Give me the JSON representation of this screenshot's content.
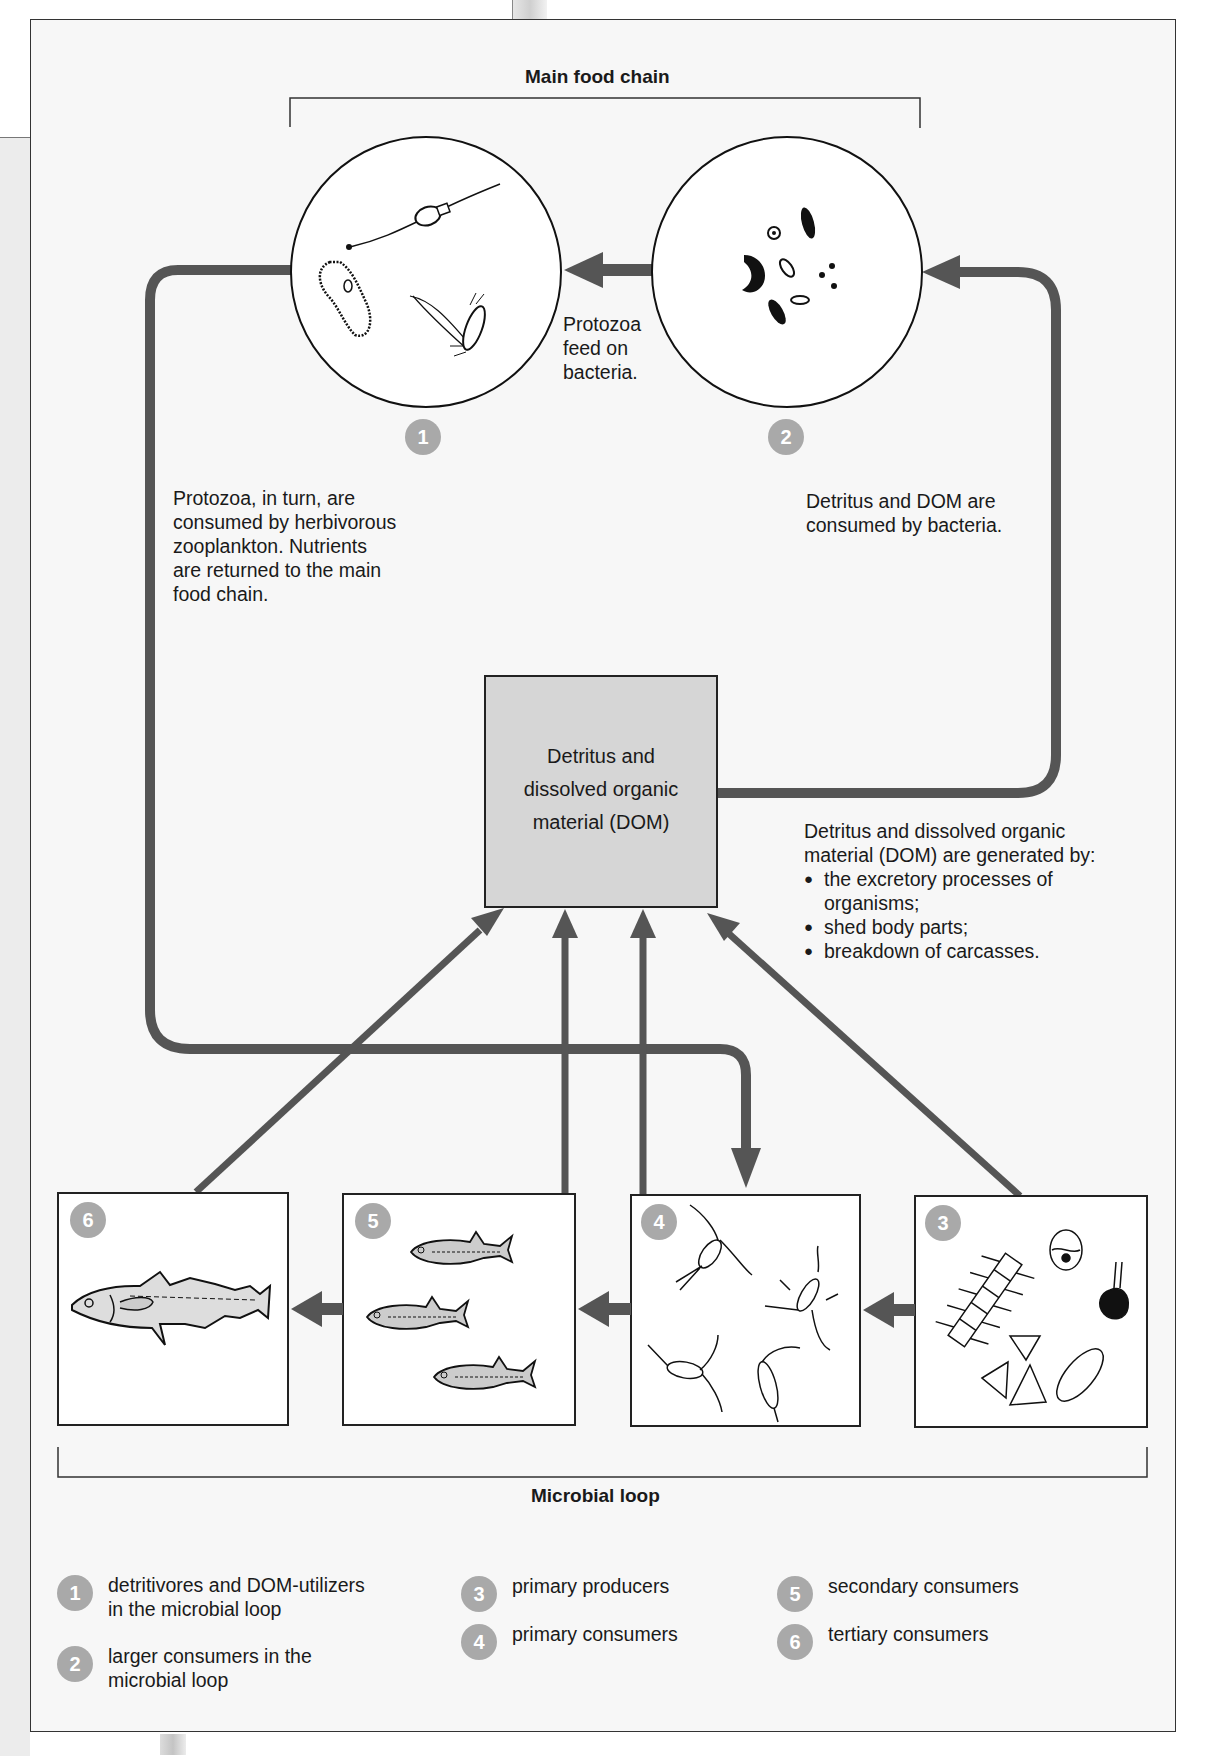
{
  "main_food_chain": {
    "title": "Main food chain",
    "circles": [
      {
        "badge": "1",
        "name": "protozoa"
      },
      {
        "badge": "2",
        "name": "bacteria"
      }
    ],
    "arrow_label": [
      "Protozoa",
      "feed on",
      "bacteria."
    ]
  },
  "annotations": {
    "left": [
      "Protozoa, in turn, are",
      "consumed by herbivorous",
      "zooplankton. Nutrients",
      "are returned to the main",
      "food chain."
    ],
    "right": [
      "Detritus and DOM are",
      "consumed by bacteria."
    ],
    "dom_generation": {
      "intro": [
        "Detritus and dissolved organic",
        "material (DOM) are generated by:"
      ],
      "bullets": [
        "the excretory processes of",
        "organisms;",
        "shed body parts;",
        "breakdown of carcasses."
      ]
    }
  },
  "dom_box": {
    "lines": [
      "Detritus and",
      "dissolved organic",
      "material (DOM)"
    ],
    "fill": "#d6d6d6"
  },
  "microbial_loop": {
    "title": "Microbial loop",
    "boxes": [
      {
        "badge": "6",
        "name": "large-fish"
      },
      {
        "badge": "5",
        "name": "small-fish"
      },
      {
        "badge": "4",
        "name": "zooplankton"
      },
      {
        "badge": "3",
        "name": "phytoplankton"
      }
    ]
  },
  "legend": [
    {
      "badge": "1",
      "lines": [
        "detritivores and DOM-utilizers",
        "in the microbial loop"
      ]
    },
    {
      "badge": "2",
      "lines": [
        "larger consumers in the",
        "microbial loop"
      ]
    },
    {
      "badge": "3",
      "lines": [
        "primary producers"
      ]
    },
    {
      "badge": "4",
      "lines": [
        "primary consumers"
      ]
    },
    {
      "badge": "5",
      "lines": [
        "secondary consumers"
      ]
    },
    {
      "badge": "6",
      "lines": [
        "tertiary consumers"
      ]
    }
  ],
  "colors": {
    "arrow": "#555555",
    "badge": "#a9a9a9",
    "frame_bg": "#f7f7f7",
    "dom_fill": "#d6d6d6"
  }
}
